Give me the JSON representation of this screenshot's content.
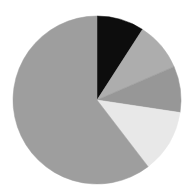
{
  "figure": {
    "background_color": "#ffffff",
    "width": 195,
    "height": 195
  },
  "chart_data": {
    "type": "pie",
    "title": "",
    "subtitle": "",
    "xlabel": "",
    "ylabel": "",
    "legend": "none",
    "grid": false,
    "labels_shown": false,
    "start_angle_deg_from_12oclock": 0,
    "direction": "clockwise",
    "center_px": [
      97,
      100
    ],
    "radius_px": 84,
    "categories": [
      "Slice 1",
      "Slice 2",
      "Slice 3",
      "Slice 4",
      "Slice 5"
    ],
    "values": [
      9.1,
      9.4,
      8.9,
      12.2,
      60.4
    ],
    "percentages": [
      "9.1%",
      "9.4%",
      "8.9%",
      "12.2%",
      "60.4%"
    ],
    "angles_deg": [
      32.8,
      33.8,
      32.0,
      43.9,
      217.5
    ],
    "colors": [
      "#0d0d0d",
      "#adadad",
      "#979797",
      "#e8e8e8",
      "#9e9e9e"
    ],
    "slices": [
      {
        "name": "Slice 1",
        "value": 9.1,
        "color": "#0d0d0d",
        "start_deg": 0.0,
        "end_deg": 32.8
      },
      {
        "name": "Slice 2",
        "value": 9.4,
        "color": "#adadad",
        "start_deg": 32.8,
        "end_deg": 66.6
      },
      {
        "name": "Slice 3",
        "value": 8.9,
        "color": "#979797",
        "start_deg": 66.6,
        "end_deg": 98.6
      },
      {
        "name": "Slice 4",
        "value": 12.2,
        "color": "#e8e8e8",
        "start_deg": 98.6,
        "end_deg": 142.5
      },
      {
        "name": "Slice 5",
        "value": 60.4,
        "color": "#9e9e9e",
        "start_deg": 142.5,
        "end_deg": 360.0
      }
    ]
  }
}
